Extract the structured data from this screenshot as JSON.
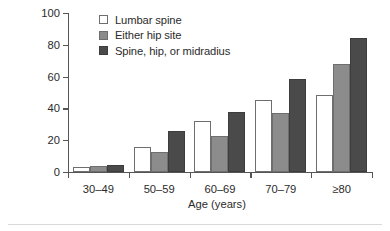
{
  "chart_data": {
    "type": "bar",
    "title": "",
    "xlabel": "Age (years)",
    "ylabel": "Low bone density (percent)",
    "categories": [
      "30–49",
      "50–59",
      "60–69",
      "70–79",
      "≥80"
    ],
    "series": [
      {
        "name": "Lumbar spine",
        "values": [
          3,
          16,
          32,
          45,
          48.5
        ],
        "color": "#ffffff"
      },
      {
        "name": "Either hip site",
        "values": [
          4,
          12.5,
          22.5,
          37,
          68
        ],
        "color": "#8c8c8c"
      },
      {
        "name": "Spine, hip, or midradius",
        "values": [
          4.5,
          26,
          38,
          58.5,
          84
        ],
        "color": "#4a4a4a"
      }
    ],
    "ylim": [
      0,
      100
    ],
    "yticks": [
      0,
      20,
      40,
      60,
      80,
      100
    ],
    "ytick_labels": [
      "0",
      "20",
      "40",
      "60",
      "80",
      "100"
    ],
    "grid": false,
    "legend_position": "upper-left-inside"
  },
  "legend": {
    "items": [
      {
        "label": "Lumbar spine"
      },
      {
        "label": "Either hip site"
      },
      {
        "label": "Spine, hip, or midradius"
      }
    ]
  },
  "axes": {
    "y_title": "Low bone density (percent)",
    "x_title": "Age (years)"
  }
}
